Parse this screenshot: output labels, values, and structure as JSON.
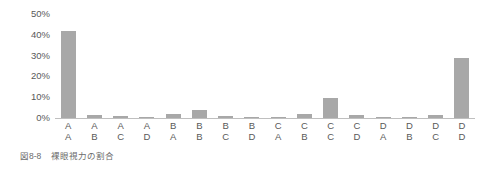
{
  "caption": {
    "number": "図8-8",
    "text": "裸眼視力の割合"
  },
  "colors": {
    "bar": "#a8a8a8",
    "text": "#595959",
    "axis": "#bfbfbf",
    "background": "#ffffff"
  },
  "chart_data": {
    "type": "bar",
    "title": "裸眼視力の割合",
    "xlabel": "",
    "ylabel": "",
    "ylim": [
      0,
      50
    ],
    "grid": false,
    "legend": null,
    "ytick_labels": [
      "50%",
      "40%",
      "30%",
      "20%",
      "10%",
      "0%"
    ],
    "ytick_values": [
      50,
      40,
      30,
      20,
      10,
      0
    ],
    "categories": [
      "A:A",
      "A:B",
      "A:C",
      "A:D",
      "B:A",
      "B:B",
      "B:C",
      "B:D",
      "C:A",
      "C:B",
      "C:C",
      "C:D",
      "D:A",
      "D:B",
      "D:C",
      "D:D"
    ],
    "category_parts": [
      {
        "top": "A",
        "bottom": "A"
      },
      {
        "top": "A",
        "bottom": "B"
      },
      {
        "top": "A",
        "bottom": "C"
      },
      {
        "top": "A",
        "bottom": "D"
      },
      {
        "top": "B",
        "bottom": "A"
      },
      {
        "top": "B",
        "bottom": "B"
      },
      {
        "top": "B",
        "bottom": "C"
      },
      {
        "top": "B",
        "bottom": "D"
      },
      {
        "top": "C",
        "bottom": "A"
      },
      {
        "top": "C",
        "bottom": "B"
      },
      {
        "top": "C",
        "bottom": "C"
      },
      {
        "top": "C",
        "bottom": "D"
      },
      {
        "top": "D",
        "bottom": "A"
      },
      {
        "top": "D",
        "bottom": "B"
      },
      {
        "top": "D",
        "bottom": "C"
      },
      {
        "top": "D",
        "bottom": "D"
      }
    ],
    "values": [
      42,
      1.5,
      1.0,
      0.7,
      2.0,
      4.0,
      0.8,
      0.5,
      0.6,
      2.0,
      9.5,
      1.5,
      0.4,
      0.3,
      1.5,
      29
    ]
  }
}
